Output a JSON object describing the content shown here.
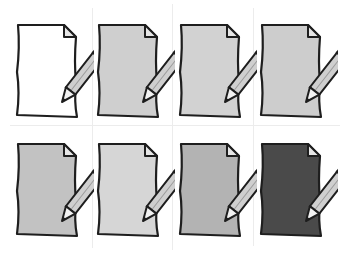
{
  "grid": {
    "columns": 4,
    "rows": 2,
    "line_color": "#ececec"
  },
  "icons": [
    {
      "name": "document-edit-icon-white",
      "paper_fill": "#ffffff",
      "row": 0,
      "col": 0
    },
    {
      "name": "document-edit-icon-light-gray",
      "paper_fill": "#cfcfcf",
      "row": 0,
      "col": 1
    },
    {
      "name": "document-edit-icon-light-gray-2",
      "paper_fill": "#d2d2d2",
      "row": 0,
      "col": 2
    },
    {
      "name": "document-edit-icon-light-gray-3",
      "paper_fill": "#cdcdcd",
      "row": 0,
      "col": 3
    },
    {
      "name": "document-edit-icon-gray",
      "paper_fill": "#c2c2c2",
      "row": 1,
      "col": 0
    },
    {
      "name": "document-edit-icon-pale-gray",
      "paper_fill": "#d6d6d6",
      "row": 1,
      "col": 1
    },
    {
      "name": "document-edit-icon-mid-gray",
      "paper_fill": "#b3b3b3",
      "row": 1,
      "col": 2
    },
    {
      "name": "document-edit-icon-dark-gray",
      "paper_fill": "#4a4a4a",
      "row": 1,
      "col": 3
    }
  ],
  "colors": {
    "outline": "#1e1e1e",
    "fold": "#e6e6e6",
    "pencil_body": "#cfcfcf",
    "pencil_eraser": "#a8a8a8",
    "pencil_tip": "#f2f2f2"
  }
}
